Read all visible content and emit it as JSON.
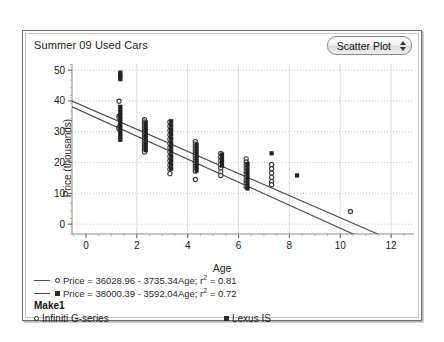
{
  "header": {
    "title": "Summer 09 Used Cars",
    "plot_type": "Scatter Plot",
    "stepper_icon": "up-down-stepper-icon"
  },
  "regression": [
    {
      "marker": "circle",
      "text": "Price = 36028.96 - 3735.34Age; r",
      "sup": "2",
      "tail": " = 0.81"
    },
    {
      "marker": "square",
      "text": "Price = 38000.39 - 3592.04Age; r",
      "sup": "2",
      "tail": " = 0.72"
    }
  ],
  "make_legend": {
    "title": "Make1",
    "items": [
      {
        "marker": "circle",
        "label": "Infiniti G-series"
      },
      {
        "marker": "square",
        "label": "Lexus IS"
      }
    ]
  },
  "chart_data": {
    "type": "scatter",
    "title": "Summer 09 Used Cars",
    "xlabel": "Age",
    "ylabel": "Price (thousands)",
    "xlim": [
      -0.55,
      12.9
    ],
    "ylim": [
      -3.2,
      52
    ],
    "xticks": [
      0,
      2,
      4,
      6,
      8,
      10,
      12
    ],
    "yticks": [
      0,
      10,
      20,
      30,
      40,
      50
    ],
    "x_minor_step": 0.5,
    "y_minor_step": 2.5,
    "grid": {
      "horizontal": "dotted",
      "vertical": "solid",
      "color": "#dcdcdc"
    },
    "legend_position": "bottom",
    "series": [
      {
        "name": "Infiniti G-series",
        "marker": "circle",
        "color": "#3a3a3a",
        "points": [
          [
            1.3,
            39.9
          ],
          [
            1.3,
            35.1
          ],
          [
            1.3,
            34.6
          ],
          [
            1.3,
            31.6
          ],
          [
            1.3,
            31.2
          ],
          [
            1.3,
            30.9
          ],
          [
            2.3,
            33.9
          ],
          [
            2.3,
            33.2
          ],
          [
            2.3,
            32.6
          ],
          [
            2.3,
            31.9
          ],
          [
            2.3,
            31.2
          ],
          [
            2.3,
            30.6
          ],
          [
            2.3,
            30.0
          ],
          [
            2.3,
            29.4
          ],
          [
            2.3,
            28.8
          ],
          [
            2.3,
            28.2
          ],
          [
            2.3,
            27.6
          ],
          [
            2.3,
            27.0
          ],
          [
            2.3,
            26.4
          ],
          [
            2.3,
            25.8
          ],
          [
            2.3,
            25.2
          ],
          [
            2.3,
            24.6
          ],
          [
            2.3,
            24.0
          ],
          [
            2.3,
            23.4
          ],
          [
            3.3,
            33.2
          ],
          [
            3.3,
            31.8
          ],
          [
            3.3,
            30.4
          ],
          [
            3.3,
            29.0
          ],
          [
            3.3,
            27.6
          ],
          [
            3.3,
            26.2
          ],
          [
            3.3,
            24.8
          ],
          [
            3.3,
            23.4
          ],
          [
            3.3,
            22.0
          ],
          [
            3.3,
            20.6
          ],
          [
            3.3,
            19.2
          ],
          [
            3.3,
            17.8
          ],
          [
            3.3,
            16.4
          ],
          [
            4.3,
            26.8
          ],
          [
            4.3,
            26.0
          ],
          [
            4.3,
            25.2
          ],
          [
            4.3,
            24.4
          ],
          [
            4.3,
            23.6
          ],
          [
            4.3,
            22.8
          ],
          [
            4.3,
            22.0
          ],
          [
            4.3,
            21.2
          ],
          [
            4.3,
            20.4
          ],
          [
            4.3,
            19.6
          ],
          [
            4.3,
            18.8
          ],
          [
            4.3,
            18.0
          ],
          [
            4.3,
            17.2
          ],
          [
            4.3,
            14.5
          ],
          [
            5.3,
            23.0
          ],
          [
            5.3,
            21.8
          ],
          [
            5.3,
            20.6
          ],
          [
            5.3,
            19.4
          ],
          [
            5.3,
            18.2
          ],
          [
            5.3,
            17.0
          ],
          [
            5.3,
            15.8
          ],
          [
            6.3,
            21.2
          ],
          [
            6.3,
            20.2
          ],
          [
            6.3,
            19.2
          ],
          [
            6.3,
            18.2
          ],
          [
            6.3,
            17.2
          ],
          [
            6.3,
            16.2
          ],
          [
            6.3,
            15.2
          ],
          [
            6.3,
            14.2
          ],
          [
            6.3,
            13.2
          ],
          [
            6.3,
            12.2
          ],
          [
            7.3,
            19.4
          ],
          [
            7.3,
            18.0
          ],
          [
            7.3,
            16.6
          ],
          [
            7.3,
            15.2
          ],
          [
            7.3,
            13.8
          ],
          [
            7.3,
            12.8
          ],
          [
            10.4,
            4.1
          ]
        ]
      },
      {
        "name": "Lexus IS",
        "marker": "square",
        "color": "#222222",
        "points": [
          [
            1.35,
            49.2
          ],
          [
            1.35,
            48.5
          ],
          [
            1.35,
            47.8
          ],
          [
            1.35,
            47.1
          ],
          [
            1.35,
            38.1
          ],
          [
            1.35,
            37.2
          ],
          [
            1.35,
            36.2
          ],
          [
            1.35,
            35.2
          ],
          [
            1.35,
            34.2
          ],
          [
            1.35,
            33.2
          ],
          [
            1.35,
            32.2
          ],
          [
            1.35,
            31.2
          ],
          [
            1.35,
            30.2
          ],
          [
            1.35,
            29.2
          ],
          [
            1.35,
            28.2
          ],
          [
            1.35,
            27.4
          ],
          [
            2.35,
            33.0
          ],
          [
            2.35,
            32.0
          ],
          [
            2.35,
            31.0
          ],
          [
            2.35,
            30.0
          ],
          [
            2.35,
            29.0
          ],
          [
            2.35,
            28.0
          ],
          [
            2.35,
            27.0
          ],
          [
            2.35,
            26.0
          ],
          [
            2.35,
            25.0
          ],
          [
            2.35,
            24.0
          ],
          [
            3.35,
            33.4
          ],
          [
            3.35,
            32.0
          ],
          [
            3.35,
            30.6
          ],
          [
            3.35,
            29.2
          ],
          [
            3.35,
            27.8
          ],
          [
            3.35,
            26.4
          ],
          [
            3.35,
            25.0
          ],
          [
            3.35,
            23.6
          ],
          [
            3.35,
            22.2
          ],
          [
            3.35,
            20.8
          ],
          [
            3.35,
            19.4
          ],
          [
            3.35,
            18.0
          ],
          [
            4.35,
            25.8
          ],
          [
            4.35,
            24.6
          ],
          [
            4.35,
            23.4
          ],
          [
            4.35,
            22.2
          ],
          [
            4.35,
            21.0
          ],
          [
            4.35,
            19.8
          ],
          [
            4.35,
            18.6
          ],
          [
            4.35,
            17.4
          ],
          [
            5.35,
            22.6
          ],
          [
            5.35,
            21.4
          ],
          [
            5.35,
            20.2
          ],
          [
            5.35,
            19.0
          ],
          [
            6.35,
            19.6
          ],
          [
            6.35,
            18.4
          ],
          [
            6.35,
            17.2
          ],
          [
            6.35,
            16.0
          ],
          [
            6.35,
            14.8
          ],
          [
            6.35,
            13.6
          ],
          [
            6.35,
            12.4
          ],
          [
            6.35,
            11.6
          ],
          [
            7.3,
            23.0
          ],
          [
            8.3,
            15.8
          ]
        ]
      }
    ],
    "fits": [
      {
        "name": "Infiniti G-series",
        "intercept": 36.02896,
        "slope": -3.73534,
        "r2": 0.81,
        "equation": "Price = 36028.96 - 3735.34Age; r2 = 0.81"
      },
      {
        "name": "Lexus IS",
        "intercept": 38.00039,
        "slope": -3.59204,
        "r2": 0.72,
        "equation": "Price = 38000.39 - 3592.04Age; r2 = 0.72"
      }
    ]
  }
}
